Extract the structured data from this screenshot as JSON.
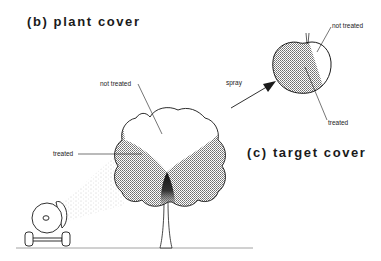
{
  "panels": {
    "plant_cover": {
      "title": "(b) plant cover",
      "labels": {
        "not_treated": "not treated",
        "treated": "treated"
      }
    },
    "target_cover": {
      "title": "(c) target cover",
      "labels": {
        "not_treated": "not treated",
        "treated": "treated",
        "spray": "spray"
      }
    }
  },
  "colors": {
    "ink": "#1a1a1a",
    "shade": "#9a9a9a",
    "dark_shade": "#2a2a2a",
    "background": "#ffffff"
  }
}
